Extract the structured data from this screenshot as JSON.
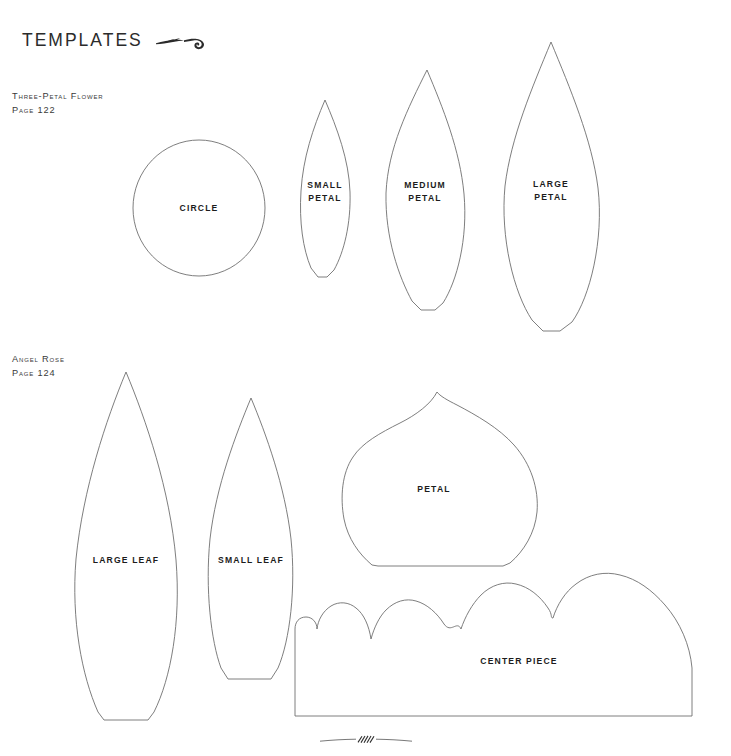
{
  "document": {
    "title": "TEMPLATES",
    "background_color": "#ffffff",
    "outline_color": "#6f6f6f",
    "text_color": "#1c1c1c"
  },
  "masthead": {
    "title": "TEMPLATES",
    "flourish_icon": "leaf-swirl-flourish-icon"
  },
  "sections": [
    {
      "id": "three-petal-flower",
      "name": "Three-Petal Flower",
      "page_reference": "Page 122",
      "shapes": [
        {
          "id": "circle",
          "label": "CIRCLE"
        },
        {
          "id": "small-petal",
          "label": "SMALL\nPETAL"
        },
        {
          "id": "medium-petal",
          "label": "MEDIUM\nPETAL"
        },
        {
          "id": "large-petal",
          "label": "LARGE\nPETAL"
        }
      ]
    },
    {
      "id": "angel-rose",
      "name": "Angel rose",
      "page_reference": "Page 124",
      "shapes": [
        {
          "id": "large-leaf",
          "label": "LARGE LEAF"
        },
        {
          "id": "small-leaf",
          "label": "SMALL LEAF"
        },
        {
          "id": "petal",
          "label": "PETAL"
        },
        {
          "id": "center-piece",
          "label": "CENTER PIECE"
        }
      ]
    }
  ],
  "footer": {
    "flourish_icon": "small-wheat-flourish-icon"
  }
}
